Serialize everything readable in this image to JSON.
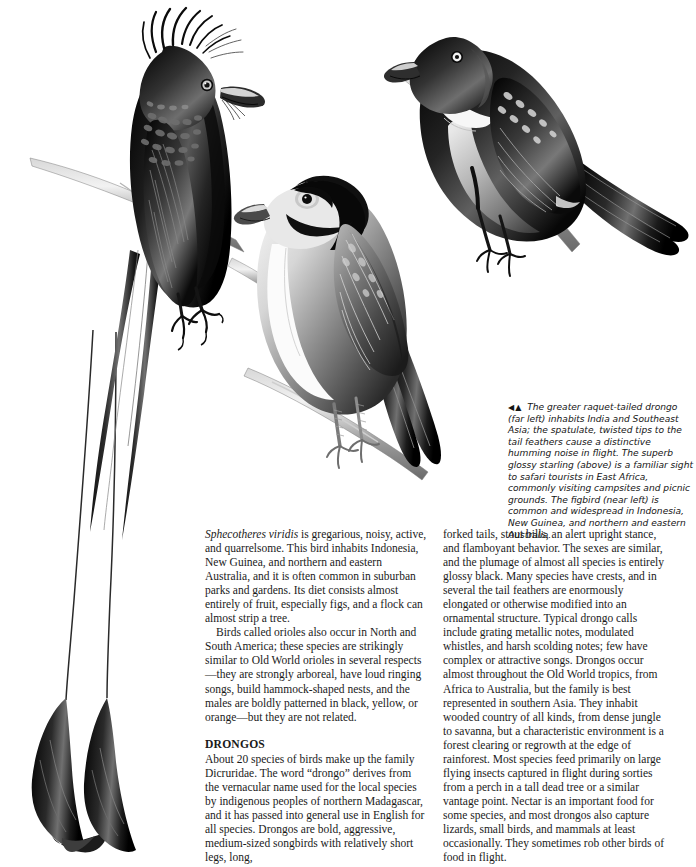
{
  "page": {
    "background": "#ffffff",
    "text_color": "#1a1a1a",
    "width": 696,
    "height": 867
  },
  "illustration": {
    "name": "drongo-oriole-plate",
    "birds": [
      {
        "id": "racquet-tailed-drongo",
        "label": "greater raquet-tailed drongo",
        "position": "far left"
      },
      {
        "id": "superb-glossy-starling",
        "label": "superb glossy starling",
        "position": "above"
      },
      {
        "id": "figbird",
        "label": "figbird",
        "position": "near left"
      }
    ]
  },
  "caption": {
    "arrows": "◀▲",
    "text": " The greater raquet-tailed drongo (far left) inhabits India and Southeast Asia; the spatulate, twisted tips to the tail feathers cause a distinctive humming noise in flight. The superb glossy starling (above) is a familiar sight to safari tourists in East Africa, commonly visiting campsites and picnic grounds. The figbird (near left) is common and widespread in Indonesia, New Guinea, and northern and eastern Australia."
  },
  "body": {
    "left_column": {
      "para1_species": "Sphecotheres viridis",
      "para1_rest": " is gregarious, noisy, active, and quarrelsome. This bird inhabits Indonesia, New Guinea, and northern and eastern Australia, and it is often common in suburban parks and gardens. Its diet consists almost entirely of fruit, especially figs, and a flock can almost strip a tree.",
      "para2": "Birds called orioles also occur in North and South America; these species are strikingly similar to Old World orioles in several respects—they are strongly arboreal, have loud ringing songs, build hammock-shaped nests, and the males are boldly patterned in black, yellow, or orange—but they are not related.",
      "heading": "DRONGOS",
      "para3": "About 20 species of birds make up the family Dicruridae. The word “drongo” derives from the vernacular name used for the local species by indigenous peoples of northern Madagascar, and it has passed into general use in English for all species. Drongos are bold, aggressive, medium-sized songbirds with relatively short legs, long,"
    },
    "right_column": {
      "para1": "forked tails, stout bills, an alert upright stance, and flamboyant behavior. The sexes are similar, and the plumage of almost all species is entirely glossy black. Many species have crests, and in several the tail feathers are enormously elongated or otherwise modified into an ornamental structure. Typical drongo calls include grating metallic notes, modulated whistles, and harsh scolding notes; few have complex or attractive songs. Drongos occur almost throughout the Old World tropics, from Africa to Australia, but the family is best represented in southern Asia. They inhabit wooded country of all kinds, from dense jungle to savanna, but a characteristic environment is a forest clearing or regrowth at the edge of rainforest. Most species feed primarily on large flying insects captured in flight during sorties from a perch in a tall dead tree or a similar vantage point. Nectar is an important food for some species, and most drongos also capture lizards, small birds, and mammals at least occasionally. They sometimes rob other birds of food in flight."
    }
  }
}
